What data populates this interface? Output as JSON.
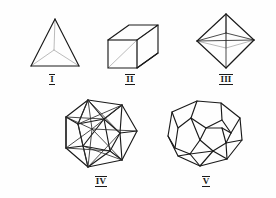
{
  "page": {
    "background_color": "#fefefe",
    "width": 276,
    "height": 198,
    "stroke_color": "#1a1a1a",
    "hidden_stroke_color": "#a9a9a9"
  },
  "figures": [
    {
      "id": "tetrahedron",
      "label": "I",
      "name": "Tetrahedron",
      "faces": 4,
      "label_x": 52,
      "label_y": 74
    },
    {
      "id": "cube",
      "label": "II",
      "name": "Cube",
      "faces": 6,
      "label_x": 130,
      "label_y": 74
    },
    {
      "id": "octahedron",
      "label": "III",
      "name": "Octahedron",
      "faces": 8,
      "label_x": 226,
      "label_y": 74
    },
    {
      "id": "icosahedron",
      "label": "IV",
      "name": "Icosahedron",
      "faces": 20,
      "label_x": 101,
      "label_y": 176
    },
    {
      "id": "dodecahedron",
      "label": "V",
      "name": "Dodecahedron",
      "faces": 12,
      "label_x": 206,
      "label_y": 176
    }
  ]
}
